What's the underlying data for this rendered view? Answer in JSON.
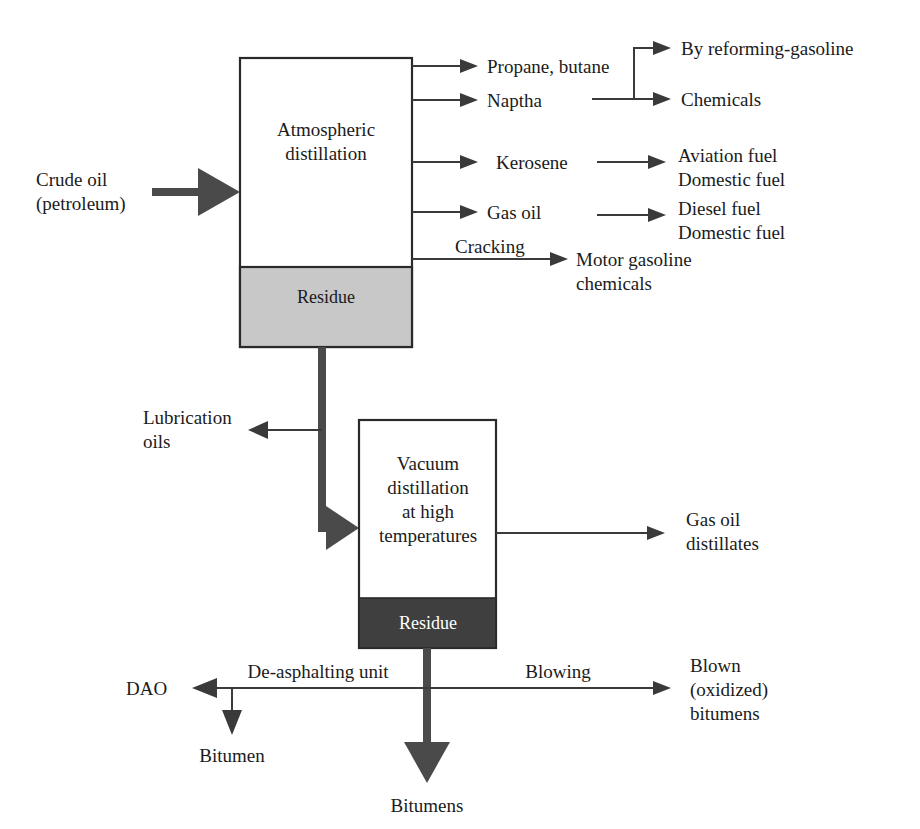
{
  "diagram": {
    "colors": {
      "line": "#3a3a3a",
      "thick_line": "#4a4a4a",
      "box_stroke": "#2a2a2a",
      "residue_light": "#c8c8c8",
      "residue_dark": "#3f3f3f",
      "text": "#1b1b1b",
      "background": "#ffffff"
    },
    "units": [
      {
        "id": "atmospheric",
        "label_line1": "Atmospheric",
        "label_line2": "distillation",
        "residue_label": "Residue",
        "residue_shade": "light"
      },
      {
        "id": "vacuum",
        "label_line1": "Vacuum",
        "label_line2": "distillation",
        "label_line3": "at high",
        "label_line4": "temperatures",
        "residue_label": "Residue",
        "residue_shade": "dark"
      }
    ],
    "feed": {
      "label_line1": "Crude oil",
      "label_line2": "(petroleum)"
    },
    "atmospheric_products": [
      {
        "id": "propane-butane",
        "label": "Propane, butane"
      },
      {
        "id": "naptha",
        "label": "Naptha"
      },
      {
        "id": "kerosene",
        "label": "Kerosene"
      },
      {
        "id": "gas-oil",
        "label": "Gas oil"
      }
    ],
    "secondary_products": [
      {
        "id": "by-reforming-gasoline",
        "label": "By reforming-gasoline"
      },
      {
        "id": "chemicals",
        "label": "Chemicals"
      },
      {
        "id": "aviation-fuel",
        "label": "Aviation fuel"
      },
      {
        "id": "domestic-fuel-kerosene",
        "label": "Domestic fuel"
      },
      {
        "id": "diesel-fuel",
        "label": "Diesel fuel"
      },
      {
        "id": "domestic-fuel-gasoil",
        "label": "Domestic fuel"
      },
      {
        "id": "motor-gasoline",
        "label": "Motor gasoline"
      },
      {
        "id": "motor-chemicals",
        "label": "chemicals"
      }
    ],
    "process_labels": [
      {
        "id": "cracking",
        "label": "Cracking"
      },
      {
        "id": "de-asphalting-unit",
        "label": "De-asphalting unit"
      },
      {
        "id": "blowing",
        "label": "Blowing"
      }
    ],
    "residue_streams": [
      {
        "id": "lubrication-oils-line1",
        "label": "Lubrication"
      },
      {
        "id": "lubrication-oils-line2",
        "label": "oils"
      }
    ],
    "vacuum_products": [
      {
        "id": "gas-oil-distillates-line1",
        "label": "Gas oil"
      },
      {
        "id": "gas-oil-distillates-line2",
        "label": "distillates"
      }
    ],
    "bottom_products": [
      {
        "id": "dao",
        "label": "DAO"
      },
      {
        "id": "bitumen",
        "label": "Bitumen"
      },
      {
        "id": "bitumens",
        "label": "Bitumens"
      },
      {
        "id": "blown-line1",
        "label": "Blown"
      },
      {
        "id": "blown-line2",
        "label": "(oxidized)"
      },
      {
        "id": "blown-line3",
        "label": "bitumens"
      }
    ]
  }
}
